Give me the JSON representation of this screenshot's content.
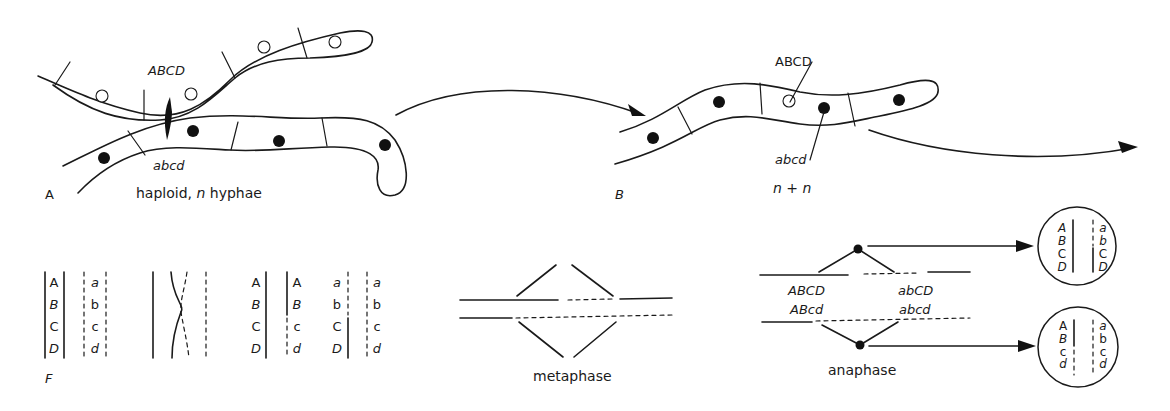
{
  "figure": {
    "panel_a": {
      "letter": "A",
      "caption_prefix": "haploid, ",
      "caption_n": "n",
      "caption_suffix": " hyphae",
      "upper_hypha_genotype": "ABCD",
      "lower_hypha_genotype": "abcd",
      "upper_nuclei": "open",
      "lower_nuclei": "filled"
    },
    "panel_b": {
      "letter": "B",
      "caption_n1": "n",
      "caption_plus": "+",
      "caption_n2": "n",
      "open_nucleus_label": "ABCD",
      "filled_nucleus_label": "abcd"
    },
    "panel_f": {
      "letter": "F",
      "homologs": {
        "solid_genes": [
          "A",
          "B",
          "C",
          "D"
        ],
        "dashed_genes": [
          "a",
          "b",
          "c",
          "d"
        ]
      },
      "recombinant_chromatids": [
        [
          "A",
          "B",
          "C",
          "D"
        ],
        [
          "A",
          "B",
          "c",
          "d"
        ],
        [
          "a",
          "b",
          "C",
          "D"
        ],
        [
          "a",
          "b",
          "c",
          "d"
        ]
      ]
    },
    "metaphase": {
      "label": "metaphase"
    },
    "anaphase": {
      "label": "anaphase",
      "upper_left_genotype": "ABCD",
      "upper_right_genotype": "abCD",
      "lower_left_genotype": "ABcd",
      "lower_right_genotype": "abcd"
    },
    "daughter_nuclei": [
      {
        "left": [
          "A",
          "B",
          "C",
          "D"
        ],
        "right": [
          "a",
          "b",
          "C",
          "D"
        ]
      },
      {
        "left": [
          "A",
          "B",
          "c",
          "d"
        ],
        "right": [
          "a",
          "b",
          "c",
          "d"
        ]
      }
    ]
  }
}
